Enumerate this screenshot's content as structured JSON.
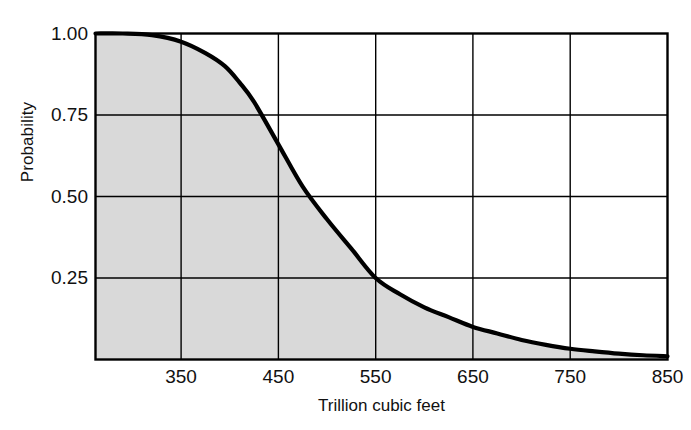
{
  "chart_data": {
    "type": "area",
    "title": "",
    "xlabel": "Trillion cubic feet",
    "ylabel": "Probability",
    "xlim": [
      262,
      850
    ],
    "ylim": [
      0,
      1.0
    ],
    "grid": true,
    "legend": false,
    "xticks": [
      350,
      450,
      550,
      650,
      750,
      850
    ],
    "xtick_labels": [
      "350",
      "450",
      "550",
      "650",
      "750",
      "850"
    ],
    "yticks": [
      0.25,
      0.5,
      0.75,
      1.0
    ],
    "ytick_labels": [
      "0.25",
      "0.50",
      "0.75",
      "1.00"
    ],
    "series": [
      {
        "name": "Probability of at least X trillion cubic feet",
        "fill": true,
        "fill_color": "#d9d9d9",
        "line_color": "#000000",
        "x": [
          262,
          290,
          320,
          350,
          375,
          395,
          410,
          425,
          450,
          475,
          500,
          525,
          550,
          575,
          600,
          625,
          650,
          675,
          700,
          725,
          750,
          775,
          800,
          825,
          850
        ],
        "y": [
          1.0,
          1.0,
          0.995,
          0.975,
          0.94,
          0.9,
          0.85,
          0.79,
          0.66,
          0.53,
          0.43,
          0.34,
          0.25,
          0.2,
          0.16,
          0.13,
          0.1,
          0.08,
          0.06,
          0.045,
          0.033,
          0.025,
          0.018,
          0.013,
          0.01
        ]
      }
    ]
  },
  "axis": {
    "ylabel": "Probability",
    "xlabel": "Trillion cubic feet"
  },
  "colors": {
    "fill": "#d9d9d9",
    "line": "#000000",
    "frame": "#000000",
    "grid": "#000000",
    "background": "#ffffff"
  }
}
